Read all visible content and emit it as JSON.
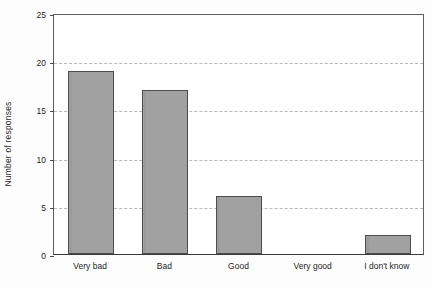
{
  "chart_data": {
    "type": "bar",
    "title": "",
    "xlabel": "",
    "ylabel": "Number of responses",
    "categories": [
      "Very bad",
      "Bad",
      "Good",
      "Very good",
      "I don't know"
    ],
    "values": [
      19,
      17,
      6,
      0,
      2
    ],
    "ylim": [
      0,
      25
    ],
    "yticks": [
      0,
      5,
      10,
      15,
      20,
      25
    ],
    "ytick_labels": [
      "0",
      "5",
      "10",
      "15",
      "20",
      "25"
    ],
    "gridlines": [
      5,
      10,
      15,
      20
    ],
    "grid": true,
    "legend": null,
    "series": [
      {
        "name": "Number of responses",
        "values": [
          19,
          17,
          6,
          0,
          2
        ]
      }
    ],
    "colors": {
      "bar_fill": "#9b9b9b",
      "bar_edge": "#4d4d4d",
      "grid": "#b9b9b9",
      "axis": "#3a3a3a",
      "text": "#242424",
      "background": "#ffffff"
    }
  }
}
